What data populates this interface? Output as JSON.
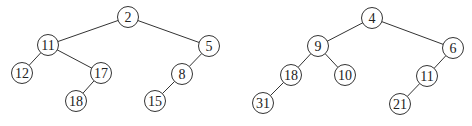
{
  "style": {
    "stroke": "#333333",
    "fill": "#ffffff",
    "text": "#222222",
    "radius": 10.5
  },
  "trees": [
    {
      "name": "left-tree",
      "nodes": [
        {
          "id": "2",
          "label": "2",
          "x": 128,
          "y": 17
        },
        {
          "id": "11",
          "label": "11",
          "x": 48,
          "y": 45
        },
        {
          "id": "5",
          "label": "5",
          "x": 209,
          "y": 46
        },
        {
          "id": "12",
          "label": "12",
          "x": 22,
          "y": 73
        },
        {
          "id": "17",
          "label": "17",
          "x": 101,
          "y": 73
        },
        {
          "id": "8",
          "label": "8",
          "x": 182,
          "y": 74
        },
        {
          "id": "18",
          "label": "18",
          "x": 76,
          "y": 101
        },
        {
          "id": "15",
          "label": "15",
          "x": 155,
          "y": 101
        }
      ],
      "edges": [
        [
          "2",
          "11"
        ],
        [
          "2",
          "5"
        ],
        [
          "11",
          "12"
        ],
        [
          "11",
          "17"
        ],
        [
          "17",
          "18"
        ],
        [
          "5",
          "8"
        ],
        [
          "8",
          "15"
        ]
      ]
    },
    {
      "name": "right-tree",
      "nodes": [
        {
          "id": "4",
          "label": "4",
          "x": 372,
          "y": 18
        },
        {
          "id": "9",
          "label": "9",
          "x": 318,
          "y": 46
        },
        {
          "id": "6",
          "label": "6",
          "x": 453,
          "y": 48
        },
        {
          "id": "18",
          "label": "18",
          "x": 291,
          "y": 75
        },
        {
          "id": "10",
          "label": "10",
          "x": 345,
          "y": 75
        },
        {
          "id": "11",
          "label": "11",
          "x": 427,
          "y": 76
        },
        {
          "id": "31",
          "label": "31",
          "x": 263,
          "y": 103
        },
        {
          "id": "21",
          "label": "21",
          "x": 400,
          "y": 104
        }
      ],
      "edges": [
        [
          "4",
          "9"
        ],
        [
          "4",
          "6"
        ],
        [
          "9",
          "18"
        ],
        [
          "9",
          "10"
        ],
        [
          "18",
          "31"
        ],
        [
          "6",
          "11"
        ],
        [
          "11",
          "21"
        ]
      ]
    }
  ]
}
